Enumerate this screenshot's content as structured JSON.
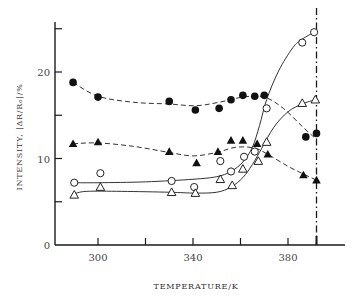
{
  "chart_data": {
    "type": "line",
    "title": "",
    "xlabel": "TEMPERATURE/K",
    "ylabel": "INTENSITY, |ΔR/R₀|/%",
    "xlim": [
      282,
      404
    ],
    "ylim": [
      0,
      26
    ],
    "x_ticks": [
      300,
      320,
      340,
      360,
      380
    ],
    "x_tick_labels": [
      "300",
      "340",
      "380"
    ],
    "y_ticks": [
      0,
      5,
      10,
      15,
      20,
      25
    ],
    "y_tick_labels": [
      "0",
      "10",
      "20"
    ],
    "grid": false,
    "legend": "none",
    "annotations": [
      {
        "type": "vertical-dash-dot-line",
        "x": 392,
        "label": ""
      }
    ],
    "series": [
      {
        "name": "filled-circles",
        "marker": "filled-circle",
        "line": "dashed",
        "points": [
          [
            289.5,
            18.8
          ],
          [
            300,
            17.1
          ],
          [
            330,
            16.6
          ],
          [
            341,
            15.6
          ],
          [
            351,
            15.8
          ],
          [
            356,
            16.8
          ],
          [
            361,
            17.3
          ],
          [
            366,
            17.2
          ],
          [
            370,
            17.3
          ],
          [
            387.5,
            12.5
          ],
          [
            392,
            12.9
          ]
        ],
        "curve": [
          [
            289.5,
            18.8
          ],
          [
            300,
            17.2
          ],
          [
            315,
            16.5
          ],
          [
            330,
            16.3
          ],
          [
            341,
            16.1
          ],
          [
            351,
            16.5
          ],
          [
            361,
            17.1
          ],
          [
            370,
            17.1
          ],
          [
            378,
            15.8
          ],
          [
            386,
            13.7
          ],
          [
            392,
            12.2
          ]
        ]
      },
      {
        "name": "filled-triangles",
        "marker": "filled-triangle",
        "line": "dashed",
        "points": [
          [
            289.5,
            11.7
          ],
          [
            300,
            11.9
          ],
          [
            330,
            10.8
          ],
          [
            341.5,
            9.5
          ],
          [
            350.5,
            10.8
          ],
          [
            356,
            12.1
          ],
          [
            361,
            12.1
          ],
          [
            367,
            11.7
          ],
          [
            371.5,
            10.5
          ],
          [
            386.5,
            8.1
          ],
          [
            392,
            7.5
          ]
        ],
        "curve": [
          [
            289.5,
            11.7
          ],
          [
            300,
            11.8
          ],
          [
            315,
            11.4
          ],
          [
            330,
            10.7
          ],
          [
            340,
            10.3
          ],
          [
            350,
            10.7
          ],
          [
            358,
            11.3
          ],
          [
            366,
            11.2
          ],
          [
            372,
            10.4
          ],
          [
            380,
            9.1
          ],
          [
            386.5,
            8.2
          ],
          [
            392,
            7.5
          ]
        ]
      },
      {
        "name": "open-circles",
        "marker": "open-circle",
        "line": "solid",
        "points": [
          [
            290,
            7.2
          ],
          [
            301,
            8.3
          ],
          [
            331,
            7.4
          ],
          [
            340.5,
            6.7
          ],
          [
            351.5,
            9.7
          ],
          [
            356,
            8.5
          ],
          [
            361.5,
            10.2
          ],
          [
            366,
            10.8
          ],
          [
            371,
            15.8
          ],
          [
            386,
            23.4
          ],
          [
            391,
            24.6
          ]
        ],
        "curve": [
          [
            290,
            7.2
          ],
          [
            300,
            7.2
          ],
          [
            320,
            7.3
          ],
          [
            340,
            7.6
          ],
          [
            350,
            7.9
          ],
          [
            356,
            8.5
          ],
          [
            361,
            9.6
          ],
          [
            365,
            11.3
          ],
          [
            368,
            13.8
          ],
          [
            371,
            16.8
          ],
          [
            376,
            20.1
          ],
          [
            382,
            22.8
          ],
          [
            386,
            23.8
          ],
          [
            391,
            24.6
          ]
        ]
      },
      {
        "name": "open-triangles",
        "marker": "open-triangle",
        "line": "solid",
        "points": [
          [
            290,
            5.8
          ],
          [
            301,
            6.7
          ],
          [
            331,
            6.1
          ],
          [
            341,
            6.0
          ],
          [
            351.5,
            7.6
          ],
          [
            356.5,
            6.9
          ],
          [
            361,
            8.8
          ],
          [
            367.5,
            9.7
          ],
          [
            371,
            11.9
          ],
          [
            386,
            16.4
          ],
          [
            391.5,
            16.8
          ]
        ],
        "curve": [
          [
            290,
            5.9
          ],
          [
            295,
            6.2
          ],
          [
            310,
            6.2
          ],
          [
            330,
            6.1
          ],
          [
            341,
            6.0
          ],
          [
            350,
            6.1
          ],
          [
            356,
            6.7
          ],
          [
            361,
            7.8
          ],
          [
            365,
            9.3
          ],
          [
            369,
            11.2
          ],
          [
            374,
            13.6
          ],
          [
            380,
            15.4
          ],
          [
            386,
            16.3
          ],
          [
            391.5,
            16.8
          ]
        ]
      }
    ]
  },
  "axes": {
    "x_title": "TEMPERATURE/K",
    "y_title": "INTENSITY, |ΔR/R₀|/%"
  }
}
